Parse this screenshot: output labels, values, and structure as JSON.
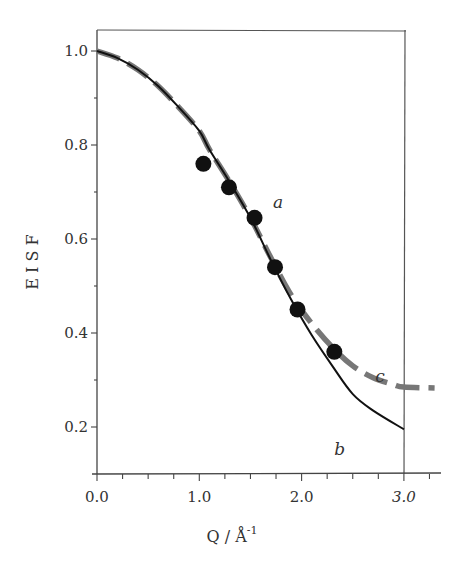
{
  "chart_data": {
    "type": "line",
    "title": "",
    "xlabel": "Q / Å",
    "xlabel_superscript": "-1",
    "ylabel": "E I S F",
    "xlim": [
      0.0,
      3.3
    ],
    "ylim": [
      0.1,
      1.045
    ],
    "grid": false,
    "legend": "none (inline curve labels a, b, c)",
    "x_ticks": [
      {
        "value": 0.0,
        "label": "0.0",
        "italic": false
      },
      {
        "value": 1.0,
        "label": "1.0",
        "italic": false
      },
      {
        "value": 2.0,
        "label": "2.0",
        "italic": false
      },
      {
        "value": 3.0,
        "label": "3.0",
        "italic": true
      }
    ],
    "x_minor_step": 0.25,
    "y_ticks": [
      {
        "value": 1.0,
        "label": "1.0"
      },
      {
        "value": 0.8,
        "label": "0.8"
      },
      {
        "value": 0.6,
        "label": "0.6"
      },
      {
        "value": 0.4,
        "label": "0.4"
      },
      {
        "value": 0.2,
        "label": "0.2"
      }
    ],
    "y_minor_step": 0.1,
    "series": [
      {
        "name": "a",
        "kind": "scatter",
        "marker": "filled-circle",
        "color": "#111111",
        "label_pos": {
          "x": 1.72,
          "y": 0.665
        },
        "x": [
          1.04,
          1.29,
          1.54,
          1.74,
          1.96,
          2.32
        ],
        "y": [
          0.76,
          0.71,
          0.645,
          0.54,
          0.45,
          0.36
        ]
      },
      {
        "name": "b",
        "kind": "line",
        "style": "solid",
        "color": "#111111",
        "label_pos": {
          "x": 2.32,
          "y": 0.14
        },
        "x": [
          0.0,
          0.2,
          0.4,
          0.6,
          0.8,
          1.0,
          1.1,
          1.3,
          1.5,
          1.7,
          1.9,
          2.1,
          2.3,
          2.5,
          2.7,
          3.0
        ],
        "y": [
          1.0,
          0.985,
          0.96,
          0.925,
          0.88,
          0.83,
          0.79,
          0.72,
          0.645,
          0.555,
          0.47,
          0.395,
          0.33,
          0.27,
          0.235,
          0.195
        ]
      },
      {
        "name": "c",
        "kind": "line",
        "style": "dashed",
        "color": "#777777",
        "label_pos": {
          "x": 2.72,
          "y": 0.295
        },
        "x": [
          0.0,
          0.2,
          0.4,
          0.6,
          0.8,
          1.0,
          1.1,
          1.3,
          1.5,
          1.7,
          1.9,
          2.1,
          2.3,
          2.5,
          2.7,
          2.9,
          3.0,
          3.3
        ],
        "y": [
          1.0,
          0.985,
          0.96,
          0.925,
          0.88,
          0.83,
          0.79,
          0.72,
          0.645,
          0.56,
          0.48,
          0.42,
          0.37,
          0.33,
          0.305,
          0.29,
          0.285,
          0.283
        ]
      }
    ]
  }
}
